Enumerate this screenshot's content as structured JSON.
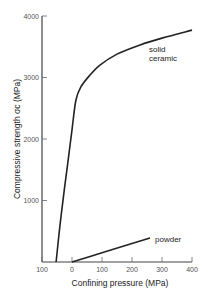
{
  "chart_data": {
    "type": "line",
    "title": "",
    "xlabel": "Confining pressure (MPa)",
    "ylabel": "Compressive strength σc (MPa)",
    "xlim": [
      -100,
      400
    ],
    "ylim": [
      0,
      4000
    ],
    "x_ticks": [
      "100",
      "0",
      "100",
      "200",
      "300",
      "400"
    ],
    "y_ticks": [
      "1000",
      "2000",
      "3000",
      "4000"
    ],
    "grid": false,
    "legend": "inline annotations",
    "series": [
      {
        "name": "solid ceramic",
        "x": [
          -53,
          -40,
          -25,
          -13,
          0,
          13,
          30,
          60,
          93,
          150,
          227,
          300,
          400
        ],
        "y": [
          0,
          600,
          1200,
          1650,
          2150,
          2630,
          2850,
          3040,
          3200,
          3380,
          3530,
          3640,
          3770
        ]
      },
      {
        "name": "powder",
        "x": [
          0,
          100,
          200,
          260
        ],
        "y": [
          0,
          150,
          300,
          390
        ]
      }
    ],
    "annotations": [
      "solid ceramic",
      "powder"
    ]
  }
}
